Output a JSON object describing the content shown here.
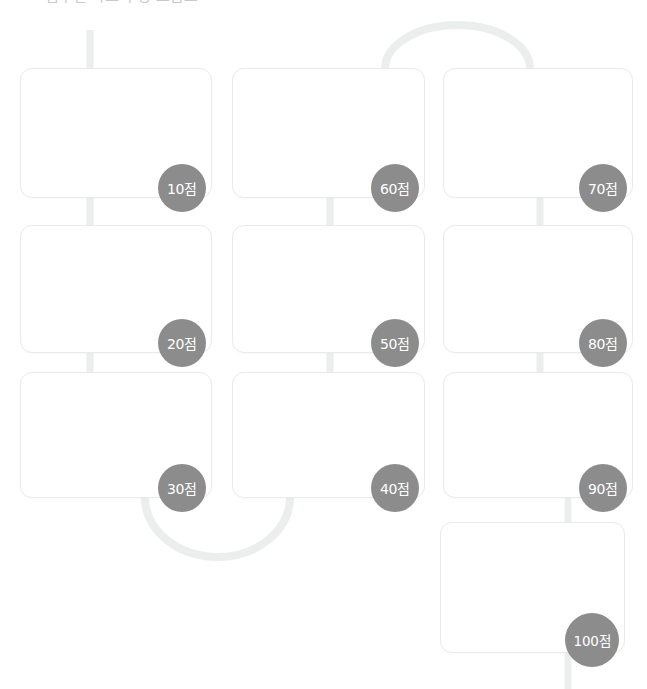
{
  "page": {
    "background_color": "#ffffff",
    "width": 647,
    "height": 689,
    "clipped_heading": "점수별 카드 구성 흐름도"
  },
  "theme": {
    "card_fill": "#ffffff",
    "card_border": "#e9eaec",
    "connector_color": "#eceded",
    "badge_fill": "#8c8c8c",
    "badge_text_color": "#ffffff"
  },
  "flow": {
    "label_suffix": "점",
    "cards": [
      {
        "id": "card-10",
        "score": "10",
        "badge_label": "10점",
        "x": 20,
        "y": 68,
        "w": 192,
        "h": 130
      },
      {
        "id": "card-60",
        "score": "60",
        "badge_label": "60점",
        "x": 232,
        "y": 68,
        "w": 193,
        "h": 130
      },
      {
        "id": "card-70",
        "score": "70",
        "badge_label": "70점",
        "x": 443,
        "y": 68,
        "w": 190,
        "h": 130
      },
      {
        "id": "card-20",
        "score": "20",
        "badge_label": "20점",
        "x": 20,
        "y": 225,
        "w": 192,
        "h": 128
      },
      {
        "id": "card-50",
        "score": "50",
        "badge_label": "50점",
        "x": 232,
        "y": 225,
        "w": 193,
        "h": 128
      },
      {
        "id": "card-80",
        "score": "80",
        "badge_label": "80점",
        "x": 443,
        "y": 225,
        "w": 190,
        "h": 128
      },
      {
        "id": "card-30",
        "score": "30",
        "badge_label": "30점",
        "x": 20,
        "y": 372,
        "w": 192,
        "h": 126
      },
      {
        "id": "card-40",
        "score": "40",
        "badge_label": "40점",
        "x": 232,
        "y": 372,
        "w": 193,
        "h": 126
      },
      {
        "id": "card-90",
        "score": "90",
        "badge_label": "90점",
        "x": 443,
        "y": 372,
        "w": 190,
        "h": 126
      },
      {
        "id": "card-100",
        "score": "100",
        "badge_label": "100점",
        "x": 440,
        "y": 522,
        "w": 185,
        "h": 131
      }
    ],
    "connectors": [
      {
        "id": "stub-entry-top",
        "type": "vertical",
        "from": "above-viewport",
        "to": "card-10",
        "x": 90,
        "y1": 30,
        "y2": 69
      },
      {
        "id": "link-10-to-20",
        "type": "vertical",
        "from": "card-10",
        "to": "card-20",
        "x": 90,
        "y1": 197,
        "y2": 226
      },
      {
        "id": "link-20-to-30",
        "type": "vertical",
        "from": "card-20",
        "to": "card-30",
        "x": 90,
        "y1": 352,
        "y2": 373
      },
      {
        "id": "link-30-to-40",
        "type": "arc-down",
        "from": "card-30",
        "to": "card-40",
        "x1": 145,
        "x2": 290,
        "y": 497,
        "depth": 60
      },
      {
        "id": "link-40-to-50",
        "type": "vertical",
        "from": "card-40",
        "to": "card-50",
        "x": 330,
        "y1": 352,
        "y2": 373
      },
      {
        "id": "link-50-to-60",
        "type": "vertical",
        "from": "card-50",
        "to": "card-60",
        "x": 330,
        "y1": 197,
        "y2": 226
      },
      {
        "id": "link-60-to-70",
        "type": "arc-up",
        "from": "card-60",
        "to": "card-70",
        "x1": 385,
        "x2": 530,
        "y": 69,
        "depth": 44
      },
      {
        "id": "link-70-to-80",
        "type": "vertical",
        "from": "card-70",
        "to": "card-80",
        "x": 540,
        "y1": 197,
        "y2": 226
      },
      {
        "id": "link-80-to-90",
        "type": "vertical",
        "from": "card-80",
        "to": "card-90",
        "x": 540,
        "y1": 352,
        "y2": 373
      },
      {
        "id": "link-90-to-100",
        "type": "vertical",
        "from": "card-90",
        "to": "card-100",
        "x": 568,
        "y1": 497,
        "y2": 523
      },
      {
        "id": "stub-exit-bottom",
        "type": "vertical",
        "from": "card-100",
        "to": "below-viewport",
        "x": 568,
        "y1": 652,
        "y2": 689
      }
    ]
  }
}
